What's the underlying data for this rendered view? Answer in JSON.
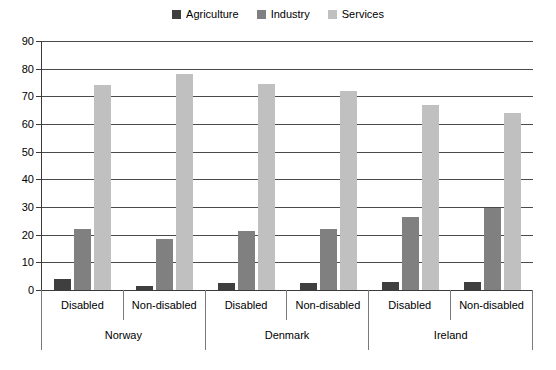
{
  "chart_data": {
    "type": "bar",
    "title": "",
    "xlabel": "",
    "ylabel": "",
    "ylim": [
      0,
      90
    ],
    "ytick_step": 10,
    "yticks": [
      90,
      80,
      70,
      60,
      50,
      40,
      30,
      20,
      10,
      0
    ],
    "grid": true,
    "legend_position": "top-center",
    "groups": [
      "Norway",
      "Denmark",
      "Ireland"
    ],
    "subcategories": [
      "Disabled",
      "Non-disabled"
    ],
    "categories": [
      "Norway / Disabled",
      "Norway / Non-disabled",
      "Denmark / Disabled",
      "Denmark / Non-disabled",
      "Ireland / Disabled",
      "Ireland / Non-disabled"
    ],
    "series": [
      {
        "name": "Agriculture",
        "color": "#3f3f3f",
        "values": [
          4,
          1.5,
          2.5,
          2.5,
          3,
          3
        ]
      },
      {
        "name": "Industry",
        "color": "#808080",
        "values": [
          22,
          18.5,
          21.5,
          22,
          26.5,
          29.5
        ]
      },
      {
        "name": "Services",
        "color": "#c0c0c0",
        "values": [
          74,
          78,
          74.5,
          72,
          67,
          64
        ]
      }
    ]
  },
  "legend": {
    "items": [
      {
        "label": "Agriculture",
        "color": "#3f3f3f",
        "swatch": "square-swatch"
      },
      {
        "label": "Industry",
        "color": "#808080",
        "swatch": "square-swatch"
      },
      {
        "label": "Services",
        "color": "#c0c0c0",
        "swatch": "square-swatch"
      }
    ]
  },
  "axis": {
    "y_labels": [
      "90",
      "80",
      "70",
      "60",
      "50",
      "40",
      "30",
      "20",
      "10",
      "0"
    ],
    "sub_labels": [
      "Disabled",
      "Non-disabled",
      "Disabled",
      "Non-disabled",
      "Disabled",
      "Non-disabled"
    ],
    "group_labels": [
      "Norway",
      "Denmark",
      "Ireland"
    ]
  },
  "style": {
    "axis_color": "#3a3a3a",
    "grid_color": "#4a4a4a",
    "background": "#ffffff"
  }
}
